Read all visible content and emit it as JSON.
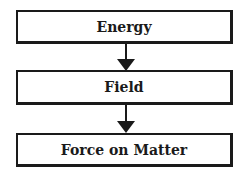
{
  "diagram": {
    "type": "flowchart",
    "nodes": [
      {
        "id": "energy",
        "label": "Energy"
      },
      {
        "id": "field",
        "label": "Field"
      },
      {
        "id": "force",
        "label": "Force on Matter"
      }
    ],
    "edges": [
      {
        "from": "energy",
        "to": "field"
      },
      {
        "from": "field",
        "to": "force"
      }
    ]
  }
}
